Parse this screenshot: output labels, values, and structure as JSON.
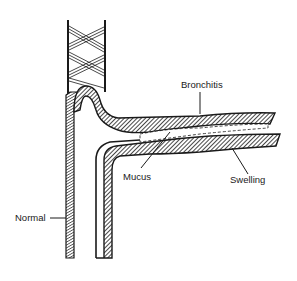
{
  "diagram": {
    "labels": {
      "bronchitis": "Bronchitis",
      "mucus": "Mucus",
      "swelling": "Swelling",
      "normal": "Normal"
    },
    "colors": {
      "ink": "#1a1a1a",
      "background": "#ffffff"
    }
  }
}
